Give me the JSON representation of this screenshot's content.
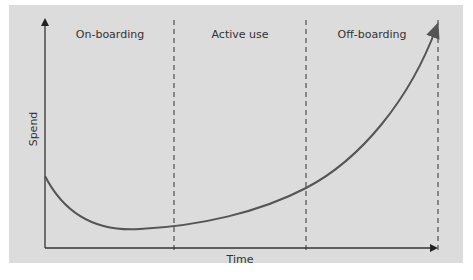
{
  "diagram": {
    "phases": [
      {
        "label": "On-boarding"
      },
      {
        "label": "Active use"
      },
      {
        "label": "Off-boarding"
      }
    ],
    "x_axis_label": "Time",
    "y_axis_label": "Spend",
    "colors": {
      "background": "#dcdcdc",
      "axis": "#333333",
      "curve": "#555555",
      "divider": "#333333"
    }
  },
  "caption": "Figure — Spend over time across phases"
}
